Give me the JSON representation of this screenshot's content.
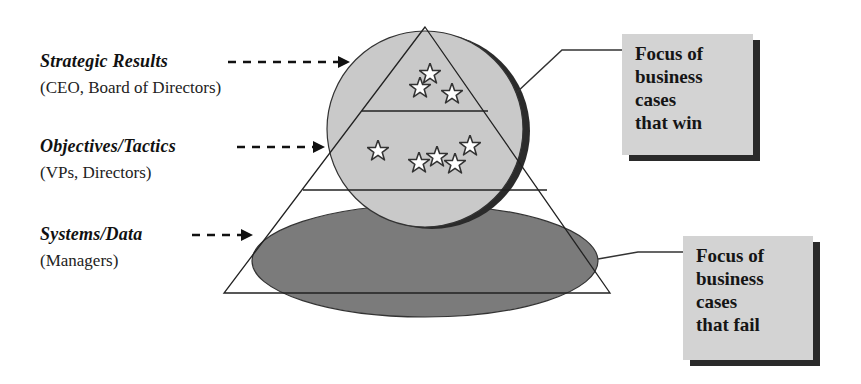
{
  "levels": [
    {
      "title": "Strategic Results",
      "audience": "(CEO, Board of Directors)"
    },
    {
      "title": "Objectives/Tactics",
      "audience": "(VPs, Directors)"
    },
    {
      "title": "Systems/Data",
      "audience": "(Managers)"
    }
  ],
  "callouts": {
    "win": {
      "text": "Focus of\nbusiness\ncases\nthat win"
    },
    "fail": {
      "text": "Focus of\nbusiness\ncases\nthat fail"
    }
  },
  "shapes": {
    "pyramid": {
      "tiers": 3,
      "stroke": "#222222"
    },
    "circle": {
      "label": "win-focus-circle",
      "fill": "#c9c9c9",
      "shadow": "#2b2b2b"
    },
    "ellipse": {
      "label": "fail-focus-ellipse",
      "fill": "#7b7b7b"
    }
  },
  "stars": {
    "top_tier_count": 3,
    "middle_tier_count": 5,
    "icon": "star-icon"
  },
  "colors": {
    "callout_fill": "#d3d3d3",
    "callout_shadow": "#2a2a2a",
    "line": "#222222"
  }
}
